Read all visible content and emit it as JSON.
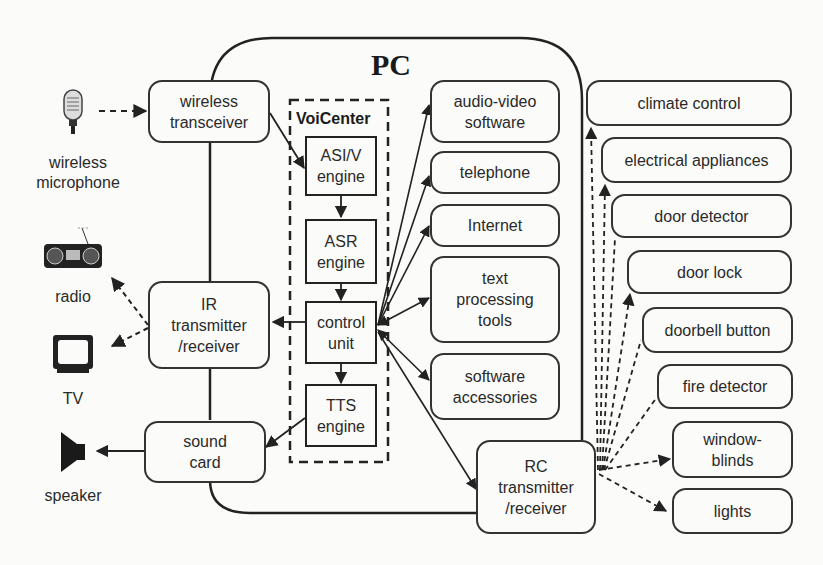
{
  "pc": {
    "title": "PC"
  },
  "voicenter": {
    "title": "VoiCenter",
    "asiv": "ASI/V\nengine",
    "asr": "ASR\nengine",
    "control": "control\nunit",
    "tts": "TTS\nengine"
  },
  "left": {
    "microphone": "wireless\nmicrophone",
    "radio": "radio",
    "tv": "TV",
    "speaker": "speaker"
  },
  "interfaces": {
    "wireless_transceiver": "wireless\ntransceiver",
    "ir": "IR\ntransmitter\n/receiver",
    "sound_card": "sound\ncard",
    "rc": "RC\ntransmitter\n/receiver"
  },
  "software": {
    "audio_video": "audio-video\nsoftware",
    "telephone": "telephone",
    "internet": "Internet",
    "text_tools": "text\nprocessing\ntools",
    "accessories": "software\naccessories"
  },
  "home": {
    "climate": "climate control",
    "electrical": "electrical appliances",
    "door_detector": "door detector",
    "door_lock": "door lock",
    "doorbell": "doorbell button",
    "fire": "fire detector",
    "blinds": "window-\nblinds",
    "lights": "lights"
  },
  "colors": {
    "line": "#2a2a2a",
    "background": "#fbfbf9"
  }
}
